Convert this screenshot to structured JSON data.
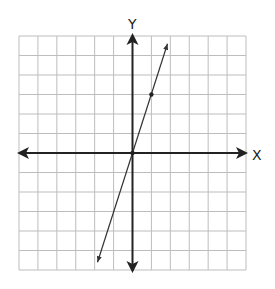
{
  "chart_data": {
    "type": "line",
    "title": "",
    "xlabel": "X",
    "ylabel": "Y",
    "xlim": [
      -6,
      6
    ],
    "ylim": [
      -6,
      6
    ],
    "grid": true,
    "grid_step": 1,
    "series": [
      {
        "name": "y = 3x",
        "equation": "y = 3x",
        "slope": 3,
        "intercept": 0,
        "x": [
          -1.85,
          1.85
        ],
        "y": [
          -5.6,
          5.6
        ],
        "arrows_both_ends": true
      }
    ],
    "points": [
      {
        "x": 0,
        "y": 0
      },
      {
        "x": 1,
        "y": 3
      }
    ]
  },
  "labels": {
    "x_axis": "X",
    "y_axis": "Y"
  },
  "colors": {
    "grid": "#bdbdbd",
    "axes": "#222222",
    "line": "#333333",
    "border": "#c8c8c8"
  }
}
